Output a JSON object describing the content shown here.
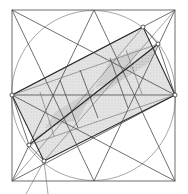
{
  "diagram": {
    "colors": {
      "background": "#ffffff",
      "line": "#4a4a4a",
      "shade_light": "#e2e2e2",
      "shade_mid": "#cfcfcf",
      "shade_dark": "#b3b3b3",
      "marker_fill": "#ffffff"
    },
    "elements": [
      "outer-square",
      "inscribed-circle",
      "diagonal-star-lines",
      "outer-rotated-rectangle",
      "inner-rotated-rectangle",
      "shaded-central-band",
      "vertex-markers"
    ],
    "marker_count": 6
  }
}
